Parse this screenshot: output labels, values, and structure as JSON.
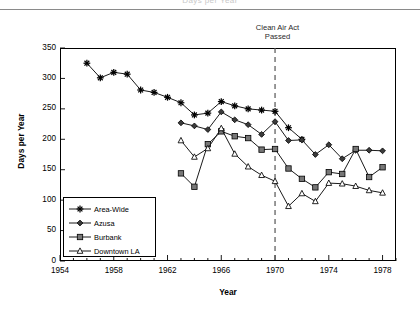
{
  "header": {
    "clipped_text": "Days per Year"
  },
  "chart_data": {
    "type": "line",
    "title": "",
    "xlabel": "Year",
    "ylabel": "Days per Year",
    "xlim": [
      1954,
      1979
    ],
    "ylim": [
      0,
      350
    ],
    "ytick_values": [
      0,
      50,
      100,
      150,
      200,
      250,
      300,
      350
    ],
    "ytick_labels": [
      "0",
      "50",
      "100",
      "150",
      "200",
      "250",
      "300",
      "350"
    ],
    "xtick_values": [
      1954,
      1958,
      1962,
      1966,
      1970,
      1974,
      1978
    ],
    "xtick_labels": [
      "1954",
      "1958",
      "1962",
      "1966",
      "1970",
      "1974",
      "1978"
    ],
    "xminor_step": 1,
    "grid": false,
    "legend_position": "lower-left",
    "annotations": [
      {
        "name": "clean-air-act-marker",
        "line1": "Clean Air Act",
        "line2": "Passed",
        "x": 1970,
        "style": "dashed-vertical"
      }
    ],
    "series": [
      {
        "name": "Area-Wide",
        "marker": "star",
        "color": "#000000",
        "x": [
          1956,
          1957,
          1958,
          1959,
          1960,
          1961,
          1962,
          1963,
          1964,
          1965,
          1966,
          1967,
          1968,
          1969,
          1970,
          1971,
          1972
        ],
        "values": [
          325,
          301,
          310,
          307,
          281,
          277,
          269,
          260,
          240,
          243,
          262,
          255,
          250,
          248,
          246,
          219,
          200
        ]
      },
      {
        "name": "Azusa",
        "marker": "diamond",
        "color": "#000000",
        "x": [
          1963,
          1964,
          1965,
          1966,
          1967,
          1968,
          1969,
          1970,
          1971,
          1972,
          1973,
          1974,
          1975,
          1976,
          1977,
          1978
        ],
        "values": [
          227,
          222,
          216,
          245,
          232,
          224,
          208,
          229,
          198,
          199,
          175,
          191,
          168,
          182,
          182,
          181
        ]
      },
      {
        "name": "Burbank",
        "marker": "square",
        "color": "#000000",
        "x": [
          1963,
          1964,
          1965,
          1966,
          1967,
          1968,
          1969,
          1970,
          1971,
          1972,
          1973,
          1974,
          1975,
          1976,
          1977,
          1978
        ],
        "values": [
          144,
          122,
          192,
          213,
          205,
          202,
          183,
          184,
          152,
          135,
          121,
          146,
          143,
          184,
          138,
          154
        ]
      },
      {
        "name": "Downtown LA",
        "marker": "triangle-open",
        "color": "#000000",
        "x": [
          1963,
          1964,
          1965,
          1966,
          1967,
          1968,
          1969,
          1970,
          1971,
          1972,
          1973,
          1974,
          1975,
          1976,
          1977,
          1978
        ],
        "values": [
          198,
          171,
          185,
          218,
          176,
          155,
          141,
          131,
          90,
          111,
          98,
          128,
          127,
          123,
          116,
          112
        ]
      }
    ]
  }
}
